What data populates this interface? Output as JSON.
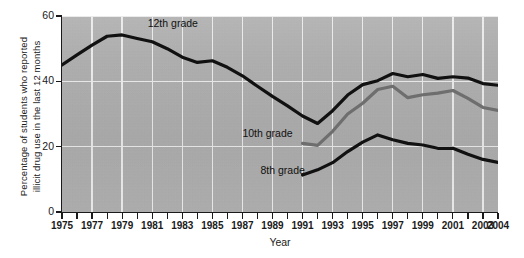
{
  "chart_data": {
    "type": "line",
    "title": "",
    "xlabel": "Year",
    "ylabel": "Percentage of students who reported\nillicit drug use in the last 12 months",
    "xlim": [
      1975,
      2004
    ],
    "ylim": [
      0,
      60
    ],
    "yticks": [
      0,
      20,
      40,
      60
    ],
    "ytick_labels": [
      "0",
      "20",
      "40",
      "60"
    ],
    "xtick_labels": [
      "1975",
      "1977",
      "1979",
      "1981",
      "1983",
      "1985",
      "1987",
      "1989",
      "1991",
      "1993",
      "1995",
      "1997",
      "1999",
      "2001",
      "2003",
      "2004"
    ],
    "xticks": [
      1975,
      1977,
      1979,
      1981,
      1983,
      1985,
      1987,
      1989,
      1991,
      1993,
      1995,
      1997,
      1999,
      2001,
      2003,
      2004
    ],
    "minor_xticks": [
      1976,
      1978,
      1980,
      1982,
      1984,
      1986,
      1988,
      1990,
      1992,
      1994,
      1996,
      1998,
      2000,
      2002
    ],
    "grid": true,
    "grid_color": "#efefef",
    "plot_background": "#b0b0b0",
    "legend_position": "inline-annotations",
    "annotations": [
      {
        "text": "12th grade",
        "x": 1980.7,
        "y": 57.5
      },
      {
        "text": "10th grade",
        "x": 1987.0,
        "y": 23.8
      },
      {
        "text": "8th grade",
        "x": 1988.2,
        "y": 12.5
      }
    ],
    "series": [
      {
        "name": "12th grade",
        "color": "#111111",
        "x": [
          1975,
          1976,
          1977,
          1978,
          1979,
          1980,
          1981,
          1982,
          1983,
          1984,
          1985,
          1986,
          1987,
          1988,
          1989,
          1990,
          1991,
          1992,
          1993,
          1994,
          1995,
          1996,
          1997,
          1998,
          1999,
          2000,
          2001,
          2002,
          2003,
          2004
        ],
        "values": [
          45.0,
          48.1,
          51.1,
          53.8,
          54.2,
          53.1,
          52.1,
          50.0,
          47.4,
          45.8,
          46.3,
          44.3,
          41.7,
          38.5,
          35.4,
          32.5,
          29.4,
          27.1,
          31.0,
          35.8,
          39.0,
          40.2,
          42.4,
          41.4,
          42.1,
          40.9,
          41.4,
          41.0,
          39.3,
          38.8
        ]
      },
      {
        "name": "10th grade",
        "color": "#6e6e6e",
        "x": [
          1991,
          1992,
          1993,
          1994,
          1995,
          1996,
          1997,
          1998,
          1999,
          2000,
          2001,
          2002,
          2003,
          2004
        ],
        "values": [
          21.0,
          20.4,
          24.7,
          30.0,
          33.3,
          37.5,
          38.5,
          35.0,
          35.9,
          36.4,
          37.2,
          34.8,
          32.0,
          31.1
        ]
      },
      {
        "name": "8th grade",
        "color": "#111111",
        "x": [
          1991,
          1992,
          1993,
          1994,
          1995,
          1996,
          1997,
          1998,
          1999,
          2000,
          2001,
          2002,
          2003,
          2004
        ],
        "values": [
          11.3,
          12.9,
          15.1,
          18.5,
          21.4,
          23.6,
          22.1,
          21.0,
          20.5,
          19.5,
          19.5,
          17.7,
          16.1,
          15.2
        ]
      }
    ]
  }
}
